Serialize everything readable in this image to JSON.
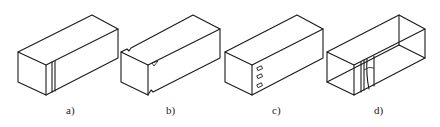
{
  "figure": {
    "stroke_color": "#1a1a1a",
    "background": "#ffffff",
    "panels": [
      {
        "id": "a",
        "label": "a)",
        "feature": "double vertical line (seam) on front side face near end",
        "label_x": 66
      },
      {
        "id": "b",
        "label": "b)",
        "feature": "notches on edges with small triangular marker",
        "label_x": 166
      },
      {
        "id": "c",
        "label": "c)",
        "feature": "three small rectangular slots on side face",
        "label_x": 272
      },
      {
        "id": "d",
        "label": "d)",
        "feature": "wireframe box with curved seam lines on side face",
        "label_x": 374
      }
    ]
  }
}
